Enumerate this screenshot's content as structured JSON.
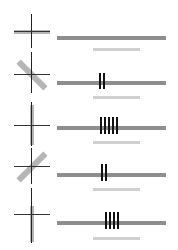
{
  "colors": {
    "crosshair": "#222222",
    "orientation_bar": "#b5b5b5",
    "main_bar": "#8e8e8e",
    "light_bar": "#d0d0d0",
    "tick": "#111111"
  },
  "rows": [
    {
      "orientation": "horizontal",
      "angle_deg": 0,
      "ticks": 0
    },
    {
      "orientation": "diagonal-down",
      "angle_deg": 45,
      "ticks": 2
    },
    {
      "orientation": "vertical",
      "angle_deg": 90,
      "ticks": 5
    },
    {
      "orientation": "diagonal-up",
      "angle_deg": -45,
      "ticks": 2
    },
    {
      "orientation": "vertical",
      "angle_deg": 90,
      "ticks": 4
    }
  ]
}
